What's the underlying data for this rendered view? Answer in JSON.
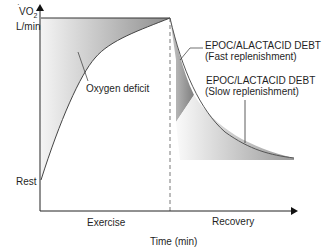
{
  "diagram": {
    "y_axis": {
      "label_main": "VO",
      "label_sub": "2",
      "label_unit": "L/min",
      "tick_label": "Rest"
    },
    "x_axis": {
      "title": "Time (min)",
      "phase_exercise": "Exercise",
      "phase_recovery": "Recovery"
    },
    "annotations": {
      "oxygen_deficit": "Oxygen deficit",
      "alactacid_title": "EPOC/ALACTACID DEBT",
      "alactacid_sub": "(Fast replenishment)",
      "lactacid_title": "EPOC/LACTACID DEBT",
      "lactacid_sub": "(Slow replenishment)"
    },
    "colors": {
      "axis": "#222222",
      "shade_dark": "#8a8a8a",
      "shade_light": "#f2f2f2"
    }
  }
}
